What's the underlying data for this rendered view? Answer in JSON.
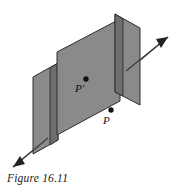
{
  "figure": {
    "caption": "Figure 16.11",
    "background_color": "#ffffff",
    "line_color": "#3b3b3b",
    "plane_fill": "#8a8a8a",
    "plane_side_fill": "#707070",
    "plane_edge_color": "#2e2e2e",
    "point_color": "#111111"
  },
  "labels": {
    "point_prime": "P'",
    "point_plain": "P"
  },
  "geometry": {
    "main_plane_points": "57,52 120,19 120,101 57,135",
    "left_plane_points": "33,77 58,63 58,140 33,154",
    "left_plane_side_points": "50,68 58,63 58,140 50,145",
    "right_plane_points": "115,14 140,28 140,105 115,92",
    "right_plane_side_points": "115,14 123,19 123,96 115,92",
    "axis_line": {
      "x1": 13,
      "y1": 167,
      "x2": 168,
      "y2": 37
    },
    "arrow_head_upper": "168,37 158,39 162,47",
    "arrow_head_lower": "13,167 23,165 19,157",
    "marker_prime": {
      "cx": 86,
      "cy": 79,
      "r": 2.6
    },
    "marker_plain": {
      "cx": 111,
      "cy": 110,
      "r": 2.6
    },
    "label_prime_pos": {
      "x": 76,
      "y": 92
    },
    "label_plain_pos": {
      "x": 103,
      "y": 123
    }
  }
}
